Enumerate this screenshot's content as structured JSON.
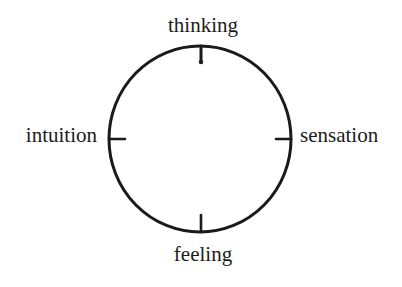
{
  "diagram": {
    "type": "circle-with-four-poles",
    "labels": {
      "top": "thinking",
      "bottom": "feeling",
      "left": "intuition",
      "right": "sensation"
    },
    "circle": {
      "cx": 200,
      "cy": 139,
      "rx": 91,
      "ry": 93,
      "stroke": "#1a1a1a"
    },
    "tick_marks": [
      "top",
      "right",
      "bottom",
      "left"
    ]
  }
}
